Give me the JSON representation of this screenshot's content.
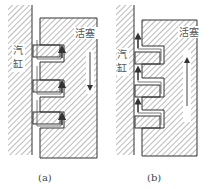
{
  "figure": {
    "panels": [
      {
        "id": "a",
        "caption": "(a)",
        "labels": {
          "piston": "活塞",
          "cylinder_top": "汽",
          "cylinder_bottom": "缸"
        },
        "motion": "down",
        "ring_position": "top-of-groove"
      },
      {
        "id": "b",
        "caption": "(b)",
        "labels": {
          "piston": "活塞",
          "cylinder_top": "汽",
          "cylinder_bottom": "缸"
        },
        "motion": "up",
        "ring_position": "bottom-of-groove"
      }
    ],
    "colors": {
      "line": "#333333",
      "hatch": "#777777",
      "text": "#555555"
    }
  }
}
